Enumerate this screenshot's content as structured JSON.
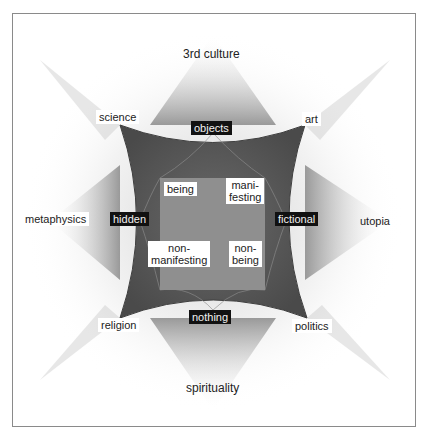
{
  "diagram": {
    "outer_labels": {
      "top": "3rd culture",
      "top_left": "science",
      "top_right": "art",
      "left": "metaphysics",
      "right": "utopia",
      "bottom_left": "religion",
      "bottom_right": "politics",
      "bottom": "spirituality"
    },
    "edge_labels": {
      "top": "objects",
      "left": "hidden",
      "right": "fictional",
      "bottom": "nothing"
    },
    "inner_labels": {
      "top_left": "being",
      "top_right_1": "mani-",
      "top_right_2": "festing",
      "bottom_left_1": "non-",
      "bottom_left_2": "manifesting",
      "bottom_right_1": "non-",
      "bottom_right_2": "being"
    },
    "colors": {
      "outer_shape": "#5a5a5a",
      "inner_square": "#8c8c8c",
      "dark_label_bg": "#111111",
      "frame_border": "#8a8a8a"
    }
  }
}
